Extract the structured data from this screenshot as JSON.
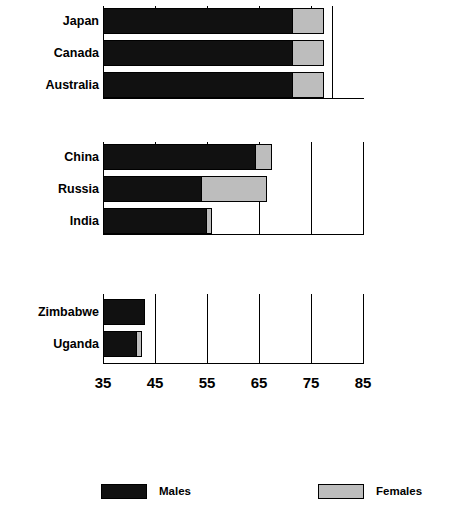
{
  "chart_data": {
    "type": "bar",
    "orientation": "horizontal",
    "title": "",
    "subtitle": "",
    "xlabel": "",
    "ylabel": "",
    "xlim": [
      35,
      85
    ],
    "xticks": [
      35,
      45,
      55,
      65,
      75,
      85
    ],
    "xtick_labels": [
      "35",
      "45",
      "55",
      "65",
      "75",
      "85"
    ],
    "grid": true,
    "grid_axis": "x",
    "legend_position": "bottom",
    "series": [
      {
        "name": "Males",
        "color": "#111111",
        "values": [
          71.5,
          71.5,
          71.5,
          64.5,
          54.0,
          55.0,
          43.0,
          41.5
        ]
      },
      {
        "name": "Females",
        "color": "#bdbdbd",
        "values": [
          77.5,
          77.5,
          77.5,
          67.5,
          66.5,
          56.0,
          43.0,
          42.5
        ]
      }
    ],
    "categories": [
      "Japan",
      "Canada",
      "Australia",
      "China",
      "Russia",
      "India",
      "Zimbabwe",
      "Uganda"
    ],
    "groups": [
      {
        "name": "group-1",
        "categories": [
          "Japan",
          "Canada",
          "Australia"
        ],
        "males": [
          71.5,
          71.5,
          71.5
        ],
        "females": [
          77.5,
          77.5,
          77.5
        ]
      },
      {
        "name": "group-2",
        "categories": [
          "China",
          "Russia",
          "India"
        ],
        "males": [
          64.5,
          54.0,
          55.0
        ],
        "females": [
          67.5,
          66.5,
          56.0
        ]
      },
      {
        "name": "group-3",
        "categories": [
          "Zimbabwe",
          "Uganda"
        ],
        "males": [
          43.0,
          41.5
        ],
        "females": [
          43.0,
          42.5
        ]
      }
    ]
  },
  "axis": {
    "tick_labels": [
      "35",
      "45",
      "55",
      "65",
      "75",
      "85"
    ]
  },
  "labels": {
    "japan": "Japan",
    "canada": "Canada",
    "australia": "Australia",
    "china": "China",
    "russia": "Russia",
    "india": "India",
    "zimbabwe": "Zimbabwe",
    "uganda": "Uganda"
  },
  "legend": {
    "males_label": "Males",
    "females_label": "Females"
  }
}
